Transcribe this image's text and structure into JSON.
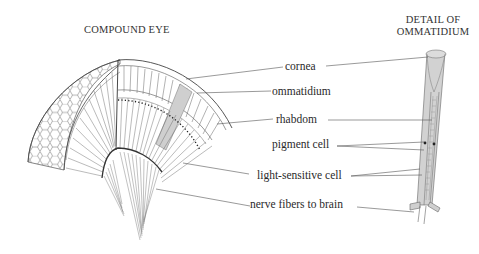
{
  "titles": {
    "left": "COMPOUND EYE",
    "right_line1": "DETAIL OF",
    "right_line2": "OMMATIDIUM"
  },
  "labels": [
    {
      "id": "cornea",
      "text": "cornea"
    },
    {
      "id": "ommatidium",
      "text": "ommatidium"
    },
    {
      "id": "rhabdom",
      "text": "rhabdom"
    },
    {
      "id": "pigment-cell",
      "text": "pigment cell"
    },
    {
      "id": "light-sensitive-cell",
      "text": "light-sensitive cell"
    },
    {
      "id": "nerve-fibers",
      "text": "nerve fibers to brain"
    }
  ],
  "colors": {
    "line": "#555555",
    "highlight": "#c8c8c8",
    "ommatidium_fill": "#cfcfcf",
    "text": "#2a2a2a"
  }
}
